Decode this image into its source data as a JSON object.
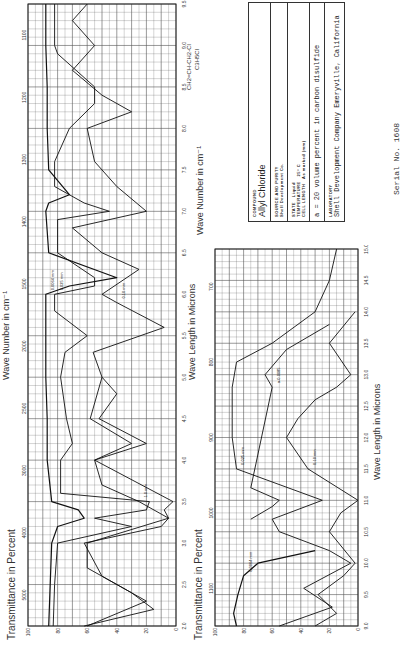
{
  "document": {
    "title": "Infrared spectrum - Allyl Chloride",
    "orientation": "page rotated 90 degrees counter-clockwise"
  },
  "info_box": {
    "compound_label": "COMPOUND",
    "compound": "Allyl Chloride",
    "source_label": "SOURCE AND PURITY",
    "source": "Shell Development Co.",
    "state_label": "STATE",
    "state": "Liquid",
    "temperature_label": "TEMPERATURE",
    "temperature": "25° C",
    "cell_length_label": "CELL LENGTH",
    "cell_length": "As marked (mm)",
    "note": "a = 20 volume percent in carbon disulfide",
    "laboratory_label": "LABORATORY",
    "laboratory": "Shell Development Company Emeryville, California",
    "serial": "Serial No. 1608"
  },
  "formula": {
    "structural": "CH2=CH-CH2-Cl",
    "molecular": "C3H5Cl"
  },
  "chart_data": [
    {
      "type": "line",
      "title": "IR spectrum 2–9.5 microns",
      "xlabel": "Wave Length in Microns",
      "x2label": "Wave Number in cm⁻¹",
      "ylabel": "Transmittance in Percent",
      "xlim": [
        2.0,
        9.5
      ],
      "ylim": [
        0,
        100
      ],
      "x_ticks": [
        "2.0",
        "2.5",
        "3.0",
        "3.5",
        "4.0",
        "4.5",
        "5.0",
        "5.5",
        "6.0",
        "6.5",
        "7.0",
        "7.5",
        "8.0",
        "8.5",
        "9.0",
        "9.5"
      ],
      "x2_ticks": [
        "5000",
        "4000",
        "3000",
        "2500",
        "2000",
        "1500",
        "1400",
        "1300",
        "1200",
        "1100"
      ],
      "y_ticks": [
        "0",
        "20",
        "40",
        "60",
        "80",
        "100"
      ],
      "series": [
        {
          "name": "0.0064 mm",
          "x": [
            2.0,
            2.5,
            3.0,
            3.2,
            3.3,
            3.4,
            3.5,
            4.0,
            4.5,
            5.0,
            5.5,
            6.0,
            6.1,
            6.2,
            6.5,
            7.0,
            7.1,
            7.2,
            7.5,
            8.0,
            8.5,
            9.0,
            9.5
          ],
          "y": [
            86,
            85,
            84,
            80,
            62,
            66,
            84,
            87,
            87,
            88,
            88,
            88,
            72,
            40,
            86,
            88,
            86,
            72,
            86,
            87,
            87,
            88,
            88
          ]
        },
        {
          "name": "0.025 mm",
          "x": [
            2.0,
            2.5,
            3.0,
            3.2,
            3.3,
            3.4,
            3.5,
            3.6,
            4.0,
            4.2,
            4.5,
            5.0,
            5.3,
            5.5,
            5.8,
            6.0,
            6.1,
            6.2,
            6.5,
            6.9,
            7.0,
            7.1,
            7.3,
            7.6,
            8.0,
            8.3,
            8.5,
            8.9,
            9.0,
            9.5
          ],
          "y": [
            83,
            82,
            80,
            30,
            55,
            20,
            18,
            78,
            78,
            70,
            74,
            78,
            75,
            60,
            82,
            82,
            55,
            55,
            80,
            80,
            45,
            62,
            82,
            82,
            72,
            55,
            55,
            80,
            82,
            82
          ]
        },
        {
          "name": "0.10 mm",
          "x": [
            2.0,
            2.3,
            2.6,
            3.0,
            3.2,
            3.3,
            3.4,
            3.5,
            4.0,
            4.2,
            4.5,
            5.0,
            5.3,
            5.6,
            5.9,
            6.0,
            6.3,
            6.5,
            6.8,
            7.0,
            7.3,
            7.6,
            8.0,
            8.2,
            8.4,
            8.7,
            9.0,
            9.3,
            9.5
          ],
          "y": [
            60,
            20,
            50,
            62,
            10,
            5,
            8,
            2,
            55,
            30,
            58,
            50,
            56,
            8,
            40,
            50,
            25,
            50,
            70,
            20,
            40,
            55,
            60,
            30,
            50,
            70,
            55,
            70,
            60
          ]
        },
        {
          "name": "1.0 mm",
          "x": [
            2.0,
            2.2,
            2.4,
            2.7,
            3.0,
            3.3,
            3.5,
            3.7,
            4.0,
            4.2,
            4.5,
            4.8,
            5.0
          ],
          "y": [
            62,
            15,
            30,
            60,
            60,
            5,
            25,
            50,
            55,
            20,
            52,
            40,
            50
          ]
        }
      ],
      "annotations": [
        "0.0064",
        "0.025",
        "0.10",
        "1.0",
        "a-0.0025"
      ]
    },
    {
      "type": "line",
      "title": "IR spectrum 9.5–15 microns",
      "xlabel": "Wave Length in Microns",
      "x2label": "Wave Number in cm⁻¹",
      "ylabel": "Transmittance in Percent",
      "xlim": [
        9.0,
        15.0
      ],
      "ylim": [
        0,
        100
      ],
      "x_ticks": [
        "9.0",
        "9.5",
        "10.0",
        "10.5",
        "11.0",
        "11.5",
        "12.0",
        "12.5",
        "13.0",
        "13.5",
        "14.0",
        "14.5",
        "15.0"
      ],
      "x2_ticks": [
        "1100",
        "1000",
        "900",
        "800",
        "700"
      ],
      "y_ticks": [
        "0",
        "20",
        "40",
        "60",
        "80",
        "100"
      ],
      "series": [
        {
          "name": "0.0064 mm",
          "x": [
            9.0,
            9.2,
            9.5,
            9.8,
            10.0,
            10.2
          ],
          "y": [
            85,
            87,
            84,
            80,
            70,
            30
          ]
        },
        {
          "name": "0.025 mm",
          "x": [
            9.0,
            9.3,
            9.6,
            10.0,
            10.2,
            10.5,
            10.7,
            11.0,
            11.5,
            12.0,
            12.3,
            12.8,
            13.2,
            13.5,
            14.0,
            14.5,
            15.0
          ],
          "y": [
            55,
            18,
            38,
            5,
            20,
            55,
            60,
            25,
            85,
            88,
            88,
            88,
            85,
            60,
            30,
            20,
            15
          ]
        },
        {
          "name": "0.10 mm",
          "x": [
            9.0,
            9.2,
            9.5,
            9.8,
            10.0,
            10.5,
            10.8,
            11.0,
            11.5,
            12.0,
            12.3,
            12.6,
            12.8,
            13.0,
            13.5,
            14.0
          ],
          "y": [
            30,
            15,
            28,
            10,
            2,
            20,
            12,
            0,
            35,
            50,
            42,
            30,
            15,
            5,
            20,
            2
          ]
        },
        {
          "name": "a-0.0085",
          "x": [
            10.7,
            10.9,
            11.0,
            11.2,
            12.8,
            13.0,
            13.4,
            13.8
          ],
          "y": [
            75,
            60,
            55,
            75,
            60,
            65,
            50,
            20
          ]
        }
      ],
      "annotations": [
        "0.0064",
        "0.025",
        "0.10",
        "a-0.0085"
      ]
    }
  ]
}
